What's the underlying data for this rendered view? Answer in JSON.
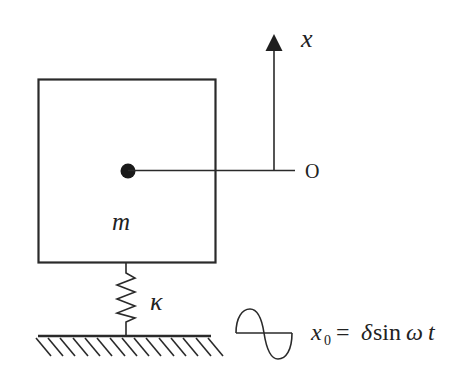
{
  "diagram": {
    "colors": {
      "stroke": "#2a2a2a",
      "background": "#ffffff"
    },
    "mass": {
      "label": "m"
    },
    "spring": {
      "label": "κ"
    },
    "axis": {
      "label": "x",
      "origin_label": "O"
    },
    "excitation": {
      "var": "x",
      "sub": "0",
      "equals": "=",
      "expr_delta": "δ",
      "expr_sin": "sin",
      "expr_omega": "ω",
      "expr_t": "t"
    }
  }
}
